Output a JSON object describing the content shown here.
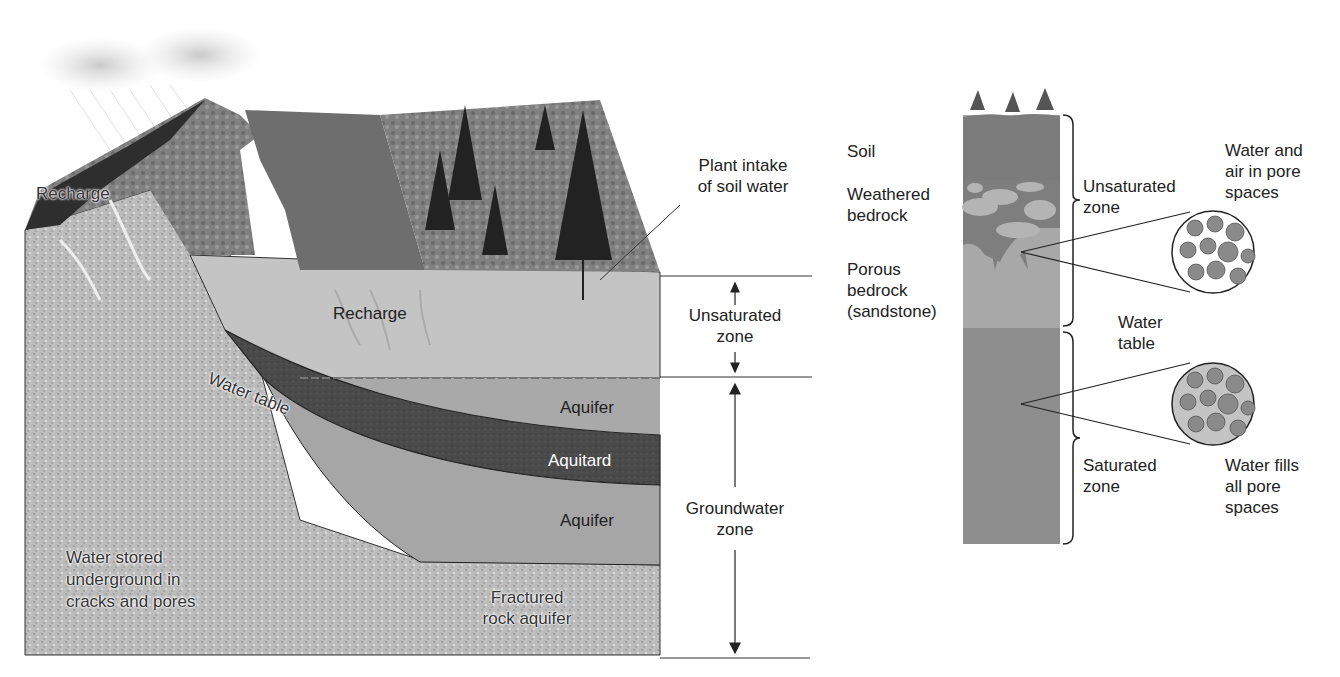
{
  "left_diagram": {
    "title": "Groundwater cross-section",
    "labels": {
      "recharge_top": "Recharge",
      "plant_intake": [
        "Plant intake",
        "of soil water"
      ],
      "recharge_mid": "Recharge",
      "water_table": "Water table",
      "aquifer_upper": "Aquifer",
      "aquitard": "Aquitard",
      "aquifer_lower": "Aquifer",
      "water_stored": [
        "Water stored",
        "underground in",
        "cracks and pores"
      ],
      "fractured_rock": [
        "Fractured",
        "rock aquifer"
      ]
    },
    "zones": {
      "unsaturated": [
        "Unsaturated",
        "zone"
      ],
      "groundwater": [
        "Groundwater",
        "zone"
      ]
    }
  },
  "right_diagram": {
    "title": "Soil column profile",
    "layers": {
      "soil": "Soil",
      "weathered_bedrock": [
        "Weathered",
        "bedrock"
      ],
      "porous_bedrock": [
        "Porous",
        "bedrock",
        "(sandstone)"
      ]
    },
    "zones": {
      "unsaturated": [
        "Unsaturated",
        "zone"
      ],
      "water_table": [
        "Water",
        "table"
      ],
      "saturated": [
        "Saturated",
        "zone"
      ]
    },
    "callouts": {
      "unsaturated_pores": [
        "Water and",
        "air in pore",
        "spaces"
      ],
      "saturated_pores": [
        "Water fills",
        "all pore",
        "spaces"
      ]
    }
  },
  "colors": {
    "sky_cloud": "#c8c8c8",
    "mountain_dark": "#2e2e2e",
    "vegetation": "#7a7a7a",
    "lake": "#6e6e6e",
    "unsaturated_fill": "#c4c4c4",
    "aquifer_fill": "#a9a9a9",
    "aquitard_fill": "#4a4a4a",
    "rock_fill": "#bdbdbd",
    "column_unsat": "#a8a8a8",
    "column_sat": "#8e8e8e",
    "column_soil": "#7c7c7c"
  }
}
